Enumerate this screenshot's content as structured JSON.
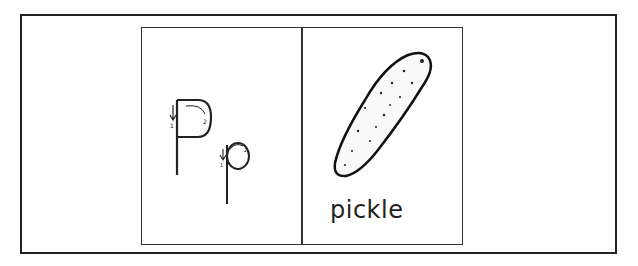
{
  "card": {
    "letter_upper": "P",
    "letter_lower": "p",
    "stroke_numbers": [
      "1",
      "2"
    ],
    "word": "pickle",
    "picture": "pickle-illustration"
  }
}
